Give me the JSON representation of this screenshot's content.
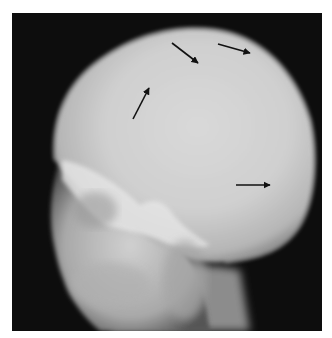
{
  "image": {
    "subject": "Lateral skull radiograph",
    "background_color": "#0d0d0d",
    "border_color": "#ffffff"
  },
  "annotations": {
    "arrows": [
      {
        "id": "arrow-1",
        "x1": 133,
        "y1": 119,
        "x2": 149,
        "y2": 88
      },
      {
        "id": "arrow-2",
        "x1": 172,
        "y1": 43,
        "x2": 198,
        "y2": 63
      },
      {
        "id": "arrow-3",
        "x1": 218,
        "y1": 44,
        "x2": 250,
        "y2": 53
      },
      {
        "id": "arrow-4",
        "x1": 236,
        "y1": 185,
        "x2": 270,
        "y2": 185
      }
    ],
    "arrow_color": "#111111"
  }
}
